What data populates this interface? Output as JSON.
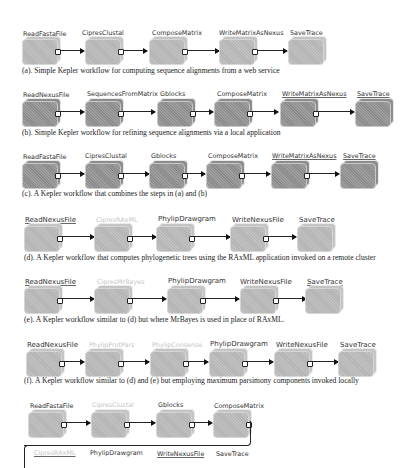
{
  "figure": {
    "workflows": [
      {
        "id": "a",
        "style": "light",
        "nodes": [
          "ReadFastaFile",
          "CipresClustal",
          "ComposeMatrix",
          "WriteMatrixAsNexus",
          "SaveTrace"
        ],
        "caption": "(a). Simple Kepler workflow for computing sequence alignments from a web service"
      },
      {
        "id": "b",
        "style": "dark",
        "nodes": [
          "ReadNexusFile",
          "SequencesFromMatrix",
          "Gblocks",
          "ComposeMatrix",
          "WriteMatrixAsNexus",
          "SaveTrace"
        ],
        "caption": "(b). Simple Kepler workflow for refining sequence alignments via a local application"
      },
      {
        "id": "c",
        "style": "dark",
        "nodes": [
          "ReadFastaFile",
          "CipresClustal",
          "Gblocks",
          "ComposeMatrix",
          "WriteMatrixAsNexus",
          "SaveTrace"
        ],
        "caption": "(c). A Kepler workflow that combines the steps in (a) and (b)"
      },
      {
        "id": "d",
        "style": "light",
        "nodes": [
          "ReadNexusFile",
          "CipresRAxML",
          "PhylipDrawgram",
          "WriteNexusFile",
          "SaveTrace"
        ],
        "faded_nodes": [
          "CipresRAxML"
        ],
        "caption": "(d). A Kepler workflow that computes phylogenetic trees using the RAxML application invoked on a remote cluster"
      },
      {
        "id": "e",
        "style": "light",
        "nodes": [
          "ReadNexusFile",
          "CipresMrBayes",
          "PhylipDrawgram",
          "WriteNexusFile",
          "SaveTrace"
        ],
        "faded_nodes": [
          "CipresMrBayes"
        ],
        "caption": "(e). A Kepler workflow similar to (d) but where MrBayes is used in place of RAxML."
      },
      {
        "id": "f",
        "style": "light",
        "nodes": [
          "ReadNexusFile",
          "PhylipProtPars",
          "PhylipConsense",
          "PhylipDrawgram",
          "WriteNexusFile",
          "SaveTrace"
        ],
        "faded_nodes": [
          "PhylipProtPars",
          "PhylipConsense"
        ],
        "caption": "(f). A Kepler workflow similar to (d) and (e) but employing maximum parsimony components invoked locally"
      },
      {
        "id": "g",
        "style": "light",
        "row1": [
          "ReadFastaFile",
          "CipresClustal",
          "Gblocks",
          "ComposeMatrix"
        ],
        "row2": [
          "CipresRAxML",
          "PhylipDrawgram",
          "WriteNexusFile",
          "SaveTrace"
        ],
        "faded_nodes": [
          "CipresClustal",
          "CipresRAxML"
        ]
      }
    ]
  }
}
